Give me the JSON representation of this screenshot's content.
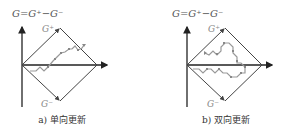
{
  "figure": {
    "panels": [
      {
        "id": "a",
        "title": "G=G⁺−G⁻",
        "g_plus_label": "G⁺",
        "g_minus_label": "G⁻",
        "caption": "a) 单向更新"
      },
      {
        "id": "b",
        "title": "G=G⁺−G⁻",
        "g_plus_label": "G⁺",
        "g_minus_label": "G⁻",
        "caption": "b) 双向更新"
      }
    ]
  },
  "colors": {
    "axis": "#222222",
    "diamond": "#444444",
    "path": "#999999",
    "marker": "#888888"
  }
}
